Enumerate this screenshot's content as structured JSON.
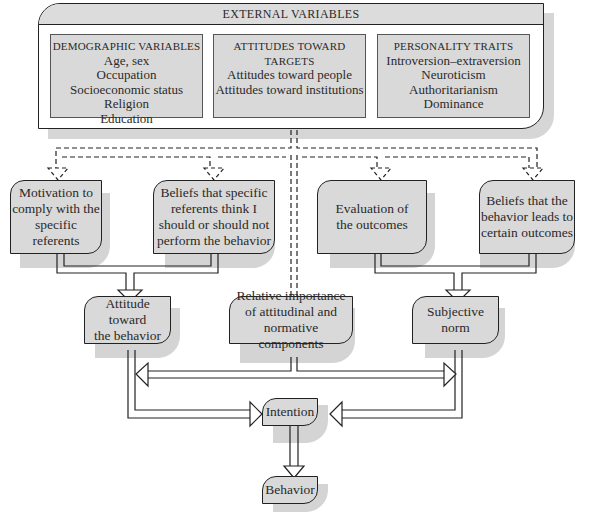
{
  "external": {
    "title": "EXTERNAL VARIABLES",
    "groups": [
      {
        "heading": "DEMOGRAPHIC VARIABLES",
        "items": [
          "Age, sex",
          "Occupation",
          "Socioeconomic status",
          "Religion",
          "Education"
        ]
      },
      {
        "heading": "ATTITUDES TOWARD",
        "heading2": "TARGETS",
        "items": [
          "Attitudes toward people",
          "Attitudes toward institutions"
        ]
      },
      {
        "heading": "PERSONALITY TRAITS",
        "items": [
          "Introversion–extraversion",
          "Neuroticism",
          "Authoritarianism",
          "Dominance"
        ]
      }
    ]
  },
  "nodes": {
    "motivation": "Motivation to\ncomply with the\nspecific referents",
    "normative_beliefs": "Beliefs that specific\nreferents think I\nshould or should not\nperform the behavior",
    "evaluation": "Evaluation of\nthe outcomes",
    "behavioral_beliefs": "Beliefs that the\nbehavior leads to\ncertain outcomes",
    "attitude": "Attitude toward\nthe behavior",
    "relative_importance": "Relative importance\nof attitudinal and\nnormative components",
    "subjective_norm": "Subjective\nnorm",
    "intention": "Intention",
    "behavior": "Behavior"
  },
  "colors": {
    "box_fill": "#d9d9d9",
    "shadow": "#d4d4d4",
    "stroke": "#222222"
  }
}
